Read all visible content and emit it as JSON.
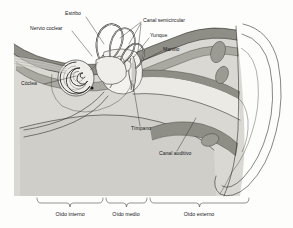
{
  "diagram": {
    "language": "es",
    "background_color": "#fdfdfc",
    "palette": {
      "bone_light": "#d9d8d3",
      "bone_mid": "#c3c2bc",
      "tissue_dark": "#8e8d86",
      "tissue_mid": "#a9a8a1",
      "canal_fill": "#cfcec8",
      "inner_pale": "#eceae5",
      "white": "#ffffff",
      "outline": "#23231f",
      "text": "#16161a"
    },
    "part_labels": [
      {
        "id": "estribo",
        "text": "Estribo",
        "text_x": 73,
        "text_y": 15,
        "anchor": "middle",
        "leader": "M 86 17 L 104 44"
      },
      {
        "id": "nervio-coclear",
        "text": "Nervio coclear",
        "text_x": 30,
        "text_y": 30,
        "anchor": "start",
        "leader": "M 72 31 L 92 56"
      },
      {
        "id": "canal-semicircular",
        "text": "Canal semicircular",
        "text_x": 143,
        "text_y": 22,
        "anchor": "start",
        "leader": "M 141 22 L 120 38 M 141 23 L 129 44 M 141 24 L 138 51"
      },
      {
        "id": "yunque",
        "text": "Yunque",
        "text_x": 150,
        "text_y": 37,
        "anchor": "start",
        "leader": "M 149 38 L 134 57"
      },
      {
        "id": "martillo",
        "text": "Martillo",
        "text_x": 163,
        "text_y": 51,
        "anchor": "start",
        "leader": "M 162 51 L 140 62"
      },
      {
        "id": "coclea",
        "text": "Cóclea",
        "text_x": 21,
        "text_y": 85,
        "anchor": "start",
        "leader": "M 44 84 L 76 76"
      },
      {
        "id": "timpano",
        "text": "Tímpano",
        "text_x": 131,
        "text_y": 130,
        "anchor": "start",
        "leader": "M 140 126 L 133 84"
      },
      {
        "id": "canal-auditivo",
        "text": "Canal auditivo",
        "text_x": 159,
        "text_y": 155,
        "anchor": "start",
        "leader": "M 177 151 L 196 118"
      }
    ],
    "region_labels": [
      {
        "id": "oido-interno",
        "text": "Oído interno",
        "text_x": 70,
        "text_y": 216,
        "brace_x1": 37,
        "brace_x2": 103,
        "brace_y": 203
      },
      {
        "id": "oido-medio",
        "text": "Oído medio",
        "text_x": 126,
        "text_y": 216,
        "brace_x1": 106,
        "brace_x2": 147,
        "brace_y": 203
      },
      {
        "id": "oido-externo",
        "text": "Oído externo",
        "text_x": 199,
        "text_y": 216,
        "brace_x1": 150,
        "brace_x2": 249,
        "brace_y": 203
      }
    ]
  }
}
